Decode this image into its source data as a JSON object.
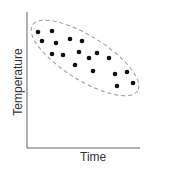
{
  "chart_data": {
    "type": "scatter",
    "title": "",
    "xlabel": "Time",
    "ylabel": "Temperature",
    "grid": false,
    "legend": null,
    "annotations": [
      "dashed ellipse enclosing all points"
    ],
    "points_px": [
      [
        38,
        32
      ],
      [
        52,
        31
      ],
      [
        42,
        41
      ],
      [
        56,
        43
      ],
      [
        70,
        39
      ],
      [
        82,
        41
      ],
      [
        52,
        54
      ],
      [
        63,
        55
      ],
      [
        79,
        52
      ],
      [
        97,
        53
      ],
      [
        89,
        58
      ],
      [
        109,
        58
      ],
      [
        75,
        65
      ],
      [
        93,
        71
      ],
      [
        115,
        74
      ],
      [
        127,
        72
      ],
      [
        117,
        86
      ],
      [
        133,
        83
      ]
    ],
    "trend": "negative correlation"
  }
}
